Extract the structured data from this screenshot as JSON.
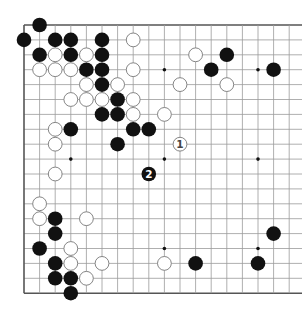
{
  "board": {
    "size": 19,
    "visible_columns": 18,
    "origin_x": 24,
    "origin_y": 25,
    "spacing_x": 15.6,
    "spacing_y": 14.9,
    "line_color": "#9a9a9a",
    "edge_color": "#555555",
    "stone_radius": 7.3,
    "black_color": "#111111",
    "white_fill": "#ffffff",
    "white_stroke": "#777777",
    "star_points": [
      [
        3,
        3
      ],
      [
        9,
        3
      ],
      [
        15,
        3
      ],
      [
        3,
        9
      ],
      [
        9,
        9
      ],
      [
        15,
        9
      ],
      [
        3,
        15
      ],
      [
        9,
        15
      ],
      [
        15,
        15
      ]
    ],
    "black_stones": [
      [
        1,
        0
      ],
      [
        0,
        1
      ],
      [
        2,
        1
      ],
      [
        3,
        1
      ],
      [
        5,
        1
      ],
      [
        1,
        2
      ],
      [
        3,
        2
      ],
      [
        5,
        2
      ],
      [
        13,
        2
      ],
      [
        4,
        3
      ],
      [
        5,
        3
      ],
      [
        12,
        3
      ],
      [
        16,
        3
      ],
      [
        5,
        4
      ],
      [
        6,
        5
      ],
      [
        5,
        6
      ],
      [
        6,
        6
      ],
      [
        3,
        7
      ],
      [
        7,
        7
      ],
      [
        8,
        7
      ],
      [
        6,
        8
      ],
      [
        2,
        13
      ],
      [
        2,
        14
      ],
      [
        16,
        14
      ],
      [
        1,
        15
      ],
      [
        2,
        16
      ],
      [
        11,
        16
      ],
      [
        15,
        16
      ],
      [
        2,
        17
      ],
      [
        3,
        17
      ],
      [
        3,
        18
      ]
    ],
    "white_stones": [
      [
        7,
        1
      ],
      [
        2,
        2
      ],
      [
        4,
        2
      ],
      [
        11,
        2
      ],
      [
        1,
        3
      ],
      [
        2,
        3
      ],
      [
        3,
        3
      ],
      [
        7,
        3
      ],
      [
        4,
        4
      ],
      [
        6,
        4
      ],
      [
        10,
        4
      ],
      [
        13,
        4
      ],
      [
        3,
        5
      ],
      [
        4,
        5
      ],
      [
        5,
        5
      ],
      [
        7,
        5
      ],
      [
        7,
        6
      ],
      [
        9,
        6
      ],
      [
        2,
        7
      ],
      [
        2,
        8
      ],
      [
        2,
        10
      ],
      [
        1,
        12
      ],
      [
        1,
        13
      ],
      [
        4,
        13
      ],
      [
        3,
        15
      ],
      [
        3,
        16
      ],
      [
        5,
        16
      ],
      [
        9,
        16
      ],
      [
        4,
        17
      ]
    ],
    "numbered_moves": [
      {
        "number": "1",
        "color": "white",
        "col": 10,
        "row": 8
      },
      {
        "number": "2",
        "color": "black",
        "col": 8,
        "row": 10
      }
    ]
  }
}
